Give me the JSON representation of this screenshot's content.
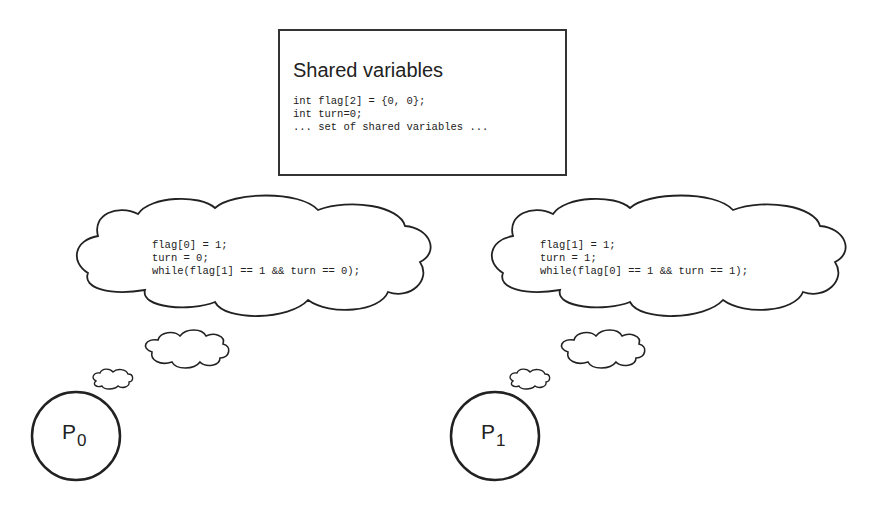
{
  "shared_box": {
    "title": "Shared variables",
    "lines": [
      "int flag[2] = {0, 0};",
      "int turn=0;",
      "... set of shared variables ..."
    ]
  },
  "processes": [
    {
      "name": "P",
      "index": "0",
      "thought_lines": [
        "flag[0] = 1;",
        "turn = 0;",
        "while(flag[1] == 1 && turn == 0);"
      ]
    },
    {
      "name": "P",
      "index": "1",
      "thought_lines": [
        "flag[1] = 1;",
        "turn = 1;",
        "while(flag[0] == 1 && turn == 1);"
      ]
    }
  ],
  "colors": {
    "stroke": "#222222",
    "background": "#ffffff"
  }
}
